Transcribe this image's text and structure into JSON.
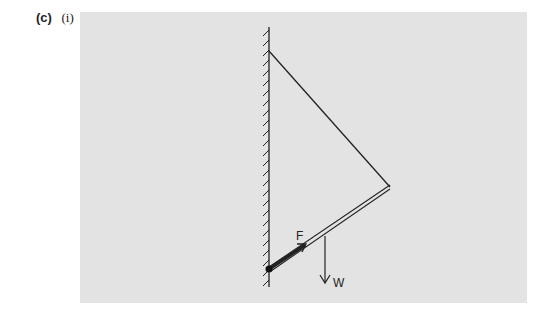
{
  "question": {
    "part": "(c)",
    "subpart": "(i)"
  },
  "diagram": {
    "background_color": "#e3e3e3",
    "labels": {
      "force_F": "F",
      "weight_W": "W"
    },
    "elements": [
      "hatched vertical wall",
      "hinged rod from wall to end point",
      "cable from wall top attachment to rod end",
      "force arrow F along rod at hinge",
      "weight arrow W downward from rod"
    ]
  }
}
